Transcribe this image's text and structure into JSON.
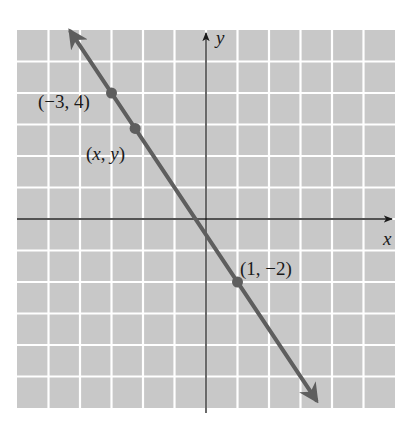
{
  "chart_data": {
    "type": "line",
    "title": "",
    "xlabel": "x",
    "ylabel": "y",
    "xlim": [
      -6,
      6
    ],
    "ylim": [
      -6,
      6
    ],
    "grid": true,
    "tick_labels_shown": false,
    "series": [
      {
        "name": "line through (-3, 4) and (1, -2)",
        "equation": "y = -1.5x - 0.5",
        "slope": -1.5,
        "intercept": -0.5,
        "x": [
          -4.3,
          3.5
        ],
        "y": [
          5.95,
          -5.75
        ],
        "arrows_both_ends": true
      }
    ],
    "points": [
      {
        "label": "(−3, 4)",
        "x": -3,
        "y": 4
      },
      {
        "label": "(x, y)",
        "x": -2.25,
        "y": 2.875
      },
      {
        "label": "(1, −2)",
        "x": 1,
        "y": -2
      }
    ],
    "annotations": [
      "(−3, 4)",
      "(x, y)",
      "(1, −2)"
    ]
  },
  "style": {
    "background": "#ffffff",
    "grid_fill": "#c8c8c8",
    "grid_line": "#ffffff",
    "axis_color": "#1a1a1a",
    "line_color": "#5e5e5e",
    "point_color": "#5e5e5e"
  },
  "labels": {
    "x_axis": "x",
    "y_axis": "y",
    "p1": "(−3, 4)",
    "p2": "(x, y)",
    "p3": "(1, −2)"
  }
}
